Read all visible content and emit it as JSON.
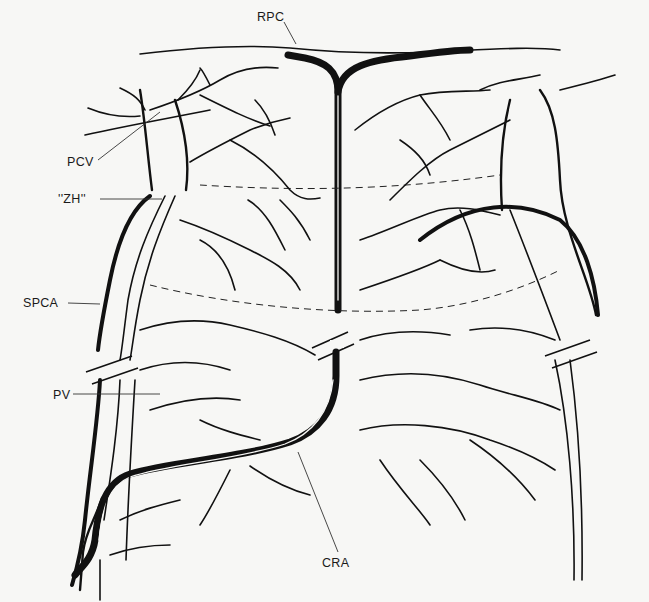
{
  "diagram": {
    "type": "anatomical line drawing",
    "colors": {
      "ink": "#111111",
      "background": "#f7f7f5"
    },
    "labels": [
      {
        "id": "rpc",
        "text": "RPC",
        "x": 257,
        "y": 10,
        "points_to": [
          296,
          44
        ]
      },
      {
        "id": "pcv",
        "text": "PCV",
        "x": 67,
        "y": 155,
        "points_to": [
          160,
          112
        ]
      },
      {
        "id": "zh",
        "text": "''ZH''",
        "x": 58,
        "y": 192,
        "points_to": [
          162,
          199
        ]
      },
      {
        "id": "spca",
        "text": "SPCA",
        "x": 23,
        "y": 296,
        "points_to": [
          100,
          304
        ]
      },
      {
        "id": "pv",
        "text": "PV",
        "x": 53,
        "y": 388,
        "points_to": [
          160,
          394
        ]
      },
      {
        "id": "cra",
        "text": "CRA",
        "x": 322,
        "y": 556,
        "points_to": [
          298,
          452
        ]
      }
    ]
  }
}
